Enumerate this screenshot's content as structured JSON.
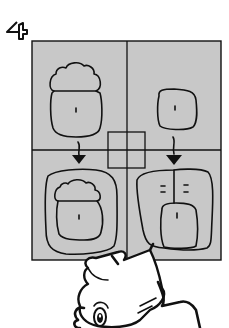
{
  "figure": {
    "step_number": "4",
    "panel_fill": "#c8c8c8",
    "line_color": "#111111",
    "background": "#ffffff",
    "panels": [
      {
        "position": "top-left",
        "shape": "cloud-top body outline (single)"
      },
      {
        "position": "top-right",
        "shape": "rounded square (single)"
      },
      {
        "position": "bottom-left",
        "shape": "cloud-top body with outer rounded border"
      },
      {
        "position": "bottom-right",
        "shape": "two-lobed outer shape with inner rounded square"
      }
    ],
    "arrows": [
      {
        "from": "top-left",
        "to": "bottom-left",
        "icon": "down-arrow-icon"
      },
      {
        "from": "top-right",
        "to": "bottom-right",
        "icon": "down-arrow-icon"
      }
    ],
    "center_marker": "small square crosshair",
    "character": "cartoon character peeking from below"
  }
}
